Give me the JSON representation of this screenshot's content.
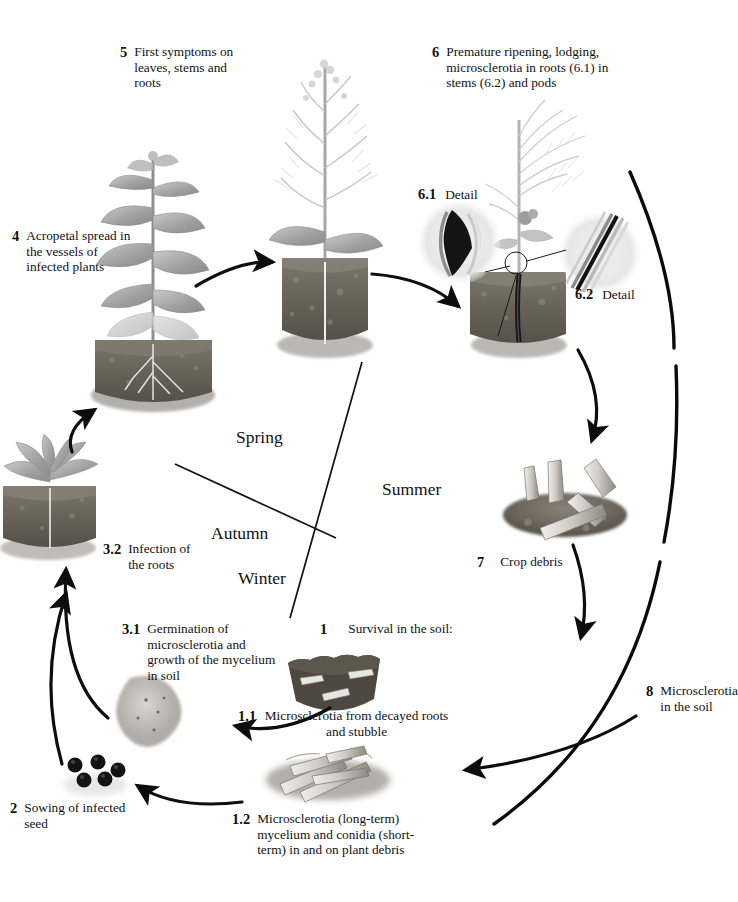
{
  "diagram": {
    "type": "disease-cycle",
    "seasons": [
      {
        "name": "Spring",
        "x": 236,
        "y": 427
      },
      {
        "name": "Summer",
        "x": 382,
        "y": 479
      },
      {
        "name": "Autumn",
        "x": 211,
        "y": 523
      },
      {
        "name": "Winter",
        "x": 238,
        "y": 568
      }
    ],
    "stages": [
      {
        "id": "1",
        "num": "1",
        "text": "Survival in the soil:",
        "x": 320,
        "y": 621,
        "layout": "inline"
      },
      {
        "id": "1.1",
        "num": "1.1",
        "text": "Microsclerotia from decayed roots and stubble",
        "x": 238,
        "y": 710,
        "layout": "block",
        "width": 200
      },
      {
        "id": "1.2",
        "num": "1.2",
        "text": "Microsclerotia (long-term) mycelium and conidia (short-term) in and on plant debris",
        "x": 232,
        "y": 812,
        "layout": "block",
        "width": 190
      },
      {
        "id": "2",
        "num": "2",
        "text": "Sowing of infected seed",
        "x": 10,
        "y": 800,
        "layout": "block",
        "width": 110
      },
      {
        "id": "3.1",
        "num": "3.1",
        "text": "Germination of microsclerotia and growth of the mycelium in soil",
        "x": 122,
        "y": 621,
        "layout": "block",
        "width": 152
      },
      {
        "id": "3.2",
        "num": "3.2",
        "text": "Infection of the roots",
        "x": 103,
        "y": 541,
        "layout": "block",
        "width": 96
      },
      {
        "id": "4",
        "num": "4",
        "text": "Acropetal spread in the vessels of infected plants",
        "x": 12,
        "y": 228,
        "layout": "block",
        "width": 110
      },
      {
        "id": "5",
        "num": "5",
        "text": "First symptoms on leaves, stems and roots",
        "x": 120,
        "y": 44,
        "layout": "block",
        "width": 120
      },
      {
        "id": "6",
        "num": "6",
        "text": "Premature ripening, lodging, microsclerotia in roots (6.1) in stems (6.2) and pods",
        "x": 432,
        "y": 44,
        "layout": "block",
        "width": 168
      },
      {
        "id": "7",
        "num": "7",
        "text": "Crop debris",
        "x": 477,
        "y": 555,
        "layout": "inline"
      },
      {
        "id": "8",
        "num": "8",
        "text": "Microsclerotia in the soil",
        "x": 646,
        "y": 684,
        "layout": "block",
        "width": 86
      }
    ],
    "details": [
      {
        "id": "6.1",
        "num": "6.1",
        "text": "Detail",
        "x": 418,
        "y": 192
      },
      {
        "id": "6.2",
        "num": "6.2",
        "text": "Detail",
        "x": 575,
        "y": 291
      }
    ],
    "colors": {
      "ink": "#111111",
      "arrow": "#0d0d0d",
      "soil_dark": "#4a443e",
      "soil_mid": "#6d665d",
      "foliage": "#a9a9a9",
      "seed": "#141414",
      "paper": "#ffffff"
    }
  }
}
